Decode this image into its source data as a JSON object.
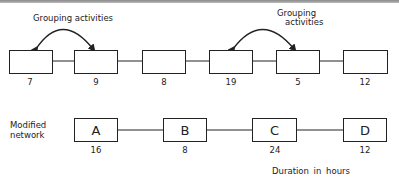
{
  "original_network": {
    "activities": [
      {
        "duration": "7"
      },
      {
        "duration": "9"
      },
      {
        "duration": "8"
      },
      {
        "duration": "19"
      },
      {
        "duration": "5"
      },
      {
        "duration": "12"
      }
    ],
    "group_annotations": [
      {
        "text": "Grouping activities",
        "from": 0,
        "to": 1
      },
      {
        "line1": "Grouping",
        "line2": "activities",
        "from": 3,
        "to": 4
      }
    ]
  },
  "modified_network": {
    "label_line1": "Modified",
    "label_line2": "network",
    "activities": [
      {
        "name": "A",
        "duration": "16"
      },
      {
        "name": "B",
        "duration": "8"
      },
      {
        "name": "C",
        "duration": "24"
      },
      {
        "name": "D",
        "duration": "12"
      }
    ]
  },
  "footer": {
    "units_label": "Duration  in hours"
  }
}
